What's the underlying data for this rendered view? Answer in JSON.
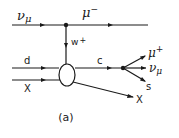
{
  "diagram": {
    "type": "feynman",
    "caption": "(a)",
    "particles": {
      "incoming_neutrino": "ν",
      "incoming_neutrino_sub": "μ",
      "outgoing_muon": "μ",
      "outgoing_muon_sup": "−",
      "boson": "w",
      "boson_sup": "+",
      "incoming_quark": "d",
      "incoming_remnant": "X",
      "charm_quark": "c",
      "decay_muon": "μ",
      "decay_muon_sup": "+",
      "decay_neutrino": "ν",
      "decay_neutrino_sub": "μ",
      "decay_strange": "s",
      "outgoing_remnant": "X"
    },
    "colors": {
      "ink": "#1a1a1a",
      "background": "#ffffff"
    }
  }
}
